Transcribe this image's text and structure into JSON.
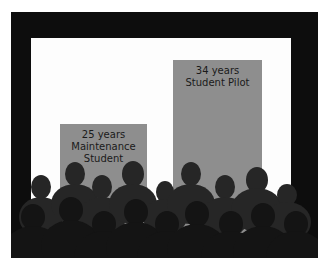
{
  "scene": {
    "description": "Audience silhouettes in front of a projection screen showing two bars",
    "colors": {
      "frame": "#0d0d0d",
      "screen": "#fdfdfd",
      "bar": "#8e8e8e",
      "text": "#1a1a1a"
    }
  },
  "bars": [
    {
      "line1": "25 years",
      "line2": "Maintenance",
      "line3": "Student"
    },
    {
      "line1": "34 years",
      "line2": "Student Pilot",
      "line3": ""
    }
  ]
}
